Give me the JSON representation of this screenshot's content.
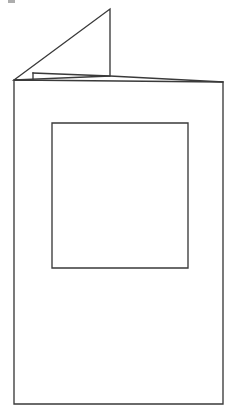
{
  "figure": {
    "title": "Folded greeting card with square aperture window",
    "caption": "",
    "background_color": "#ffffff",
    "stroke_color": "#3a3a3a",
    "stroke_width": 1.35,
    "canvas": {
      "width": 235,
      "height": 411
    }
  },
  "parts": {
    "front_panel": {
      "label": "front-panel",
      "description": "Large upright rectangular card front",
      "points": "14,80 223,82 223,404 14,404"
    },
    "open_flap_triangle": {
      "label": "open-flap-triangle",
      "description": "Triangular folded-back flap rising above the card",
      "points": "14,80 110,9 110,76"
    },
    "flap_fold_edge": {
      "label": "flap-fold-edge",
      "description": "Inner fold line running from the small left step across to the right corner",
      "points": "33,73 110,76 223,82"
    },
    "flap_left_step": {
      "label": "flap-left-step",
      "description": "Short vertical riser joining the fold edge to the card top",
      "points": "33,73 33,80"
    },
    "card_top_edge": {
      "label": "card-top-edge",
      "description": "Top edge of the card front sloping slightly down to the right",
      "points": "14,80 223,82"
    },
    "aperture_window": {
      "label": "aperture-window",
      "description": "Square cut-out window on the card front",
      "points": "52,123 188,123 188,268 52,268"
    }
  },
  "geometry": {
    "front_panel_left_x": 14,
    "front_panel_right_x": 223,
    "front_panel_top_left_y": 80,
    "front_panel_top_right_y": 82,
    "front_panel_bottom_y": 404,
    "triangle_apex_x": 110,
    "triangle_apex_y": 9,
    "triangle_base_y": 76,
    "flap_step_x": 33,
    "flap_step_top_y": 73,
    "aperture_left_x": 52,
    "aperture_right_x": 188,
    "aperture_top_y": 123,
    "aperture_bottom_y": 268,
    "aperture_width": 136,
    "aperture_height": 145
  },
  "artifact": {
    "label": "scan-speck",
    "color": "#6a6a6a"
  }
}
